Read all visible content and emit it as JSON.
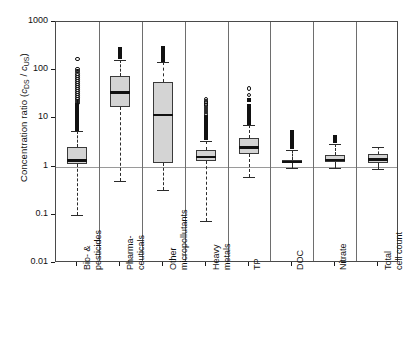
{
  "chart_data": {
    "type": "box",
    "title": "",
    "xlabel": "",
    "ylabel": "Concentration ratio (cDS / cUS)",
    "ylabel_parts": {
      "main": "Concentration ratio  (",
      "c1": "c",
      "sub1": "DS",
      "slash": " / ",
      "c2": "c",
      "sub2": "US",
      "close": ")"
    },
    "yscale": "log",
    "ylim": [
      0.01,
      1000
    ],
    "yticks": [
      1000,
      100,
      10,
      1,
      0.1,
      0.01
    ],
    "ytick_labels": [
      "1000",
      "100",
      "10",
      "1",
      "0.1",
      "0.01"
    ],
    "grid": false,
    "reference_line": 1,
    "legend": "none",
    "categories": [
      "Bio- & pesticides",
      "Pharma- ceuticals",
      "Other micropollutants",
      "Heavy metals",
      "TP",
      "DOC",
      "Nitrate",
      "Total cell count"
    ],
    "category_lines": [
      [
        "Bio- &",
        "pesticides"
      ],
      [
        "Pharma-",
        "ceuticals"
      ],
      [
        "Other",
        "micropollutants"
      ],
      [
        "Heavy",
        "metals"
      ],
      [
        "TP"
      ],
      [
        "DOC"
      ],
      [
        "Nitrate"
      ],
      [
        "Total",
        "cell count"
      ]
    ],
    "boxes": [
      {
        "name": "Bio- & pesticides",
        "lower_whisker": 0.1,
        "q1": 1.15,
        "median": 1.35,
        "q3": 2.6,
        "upper_whisker": 5.5,
        "outliers": [
          6.0,
          6.5,
          7.0,
          7.6,
          8.3,
          9.0,
          9.8,
          10.6,
          11.5,
          12.5,
          13.6,
          14.8,
          16,
          17.5,
          19,
          21,
          23,
          25,
          27,
          30,
          33,
          36,
          40,
          44,
          48,
          53,
          58,
          64,
          70,
          78,
          86,
          95,
          105,
          170
        ]
      },
      {
        "name": "Pharma-ceuticals",
        "lower_whisker": 0.5,
        "q1": 17,
        "median": 35,
        "q3": 75,
        "upper_whisker": 165,
        "outliers": [
          180,
          195,
          215,
          235,
          260,
          285
        ]
      },
      {
        "name": "Other micropollutants",
        "lower_whisker": 0.33,
        "q1": 1.2,
        "median": 12,
        "q3": 58,
        "upper_whisker": 145,
        "outliers": [
          160,
          175,
          190,
          205,
          225,
          250,
          275,
          300
        ]
      },
      {
        "name": "Heavy metals",
        "lower_whisker": 0.075,
        "q1": 1.3,
        "median": 1.6,
        "q3": 2.2,
        "upper_whisker": 3.4,
        "outliers": [
          3.8,
          4.2,
          4.6,
          5.1,
          5.6,
          6.2,
          6.8,
          7.5,
          8.3,
          9.1,
          10,
          11,
          12.2,
          13.5,
          15,
          16.6,
          18.4,
          20.4,
          22.6,
          25
        ]
      },
      {
        "name": "TP",
        "lower_whisker": 0.62,
        "q1": 1.85,
        "median": 2.5,
        "q3": 4.0,
        "upper_whisker": 7.2,
        "outliers": [
          8,
          8.8,
          9.7,
          10.7,
          11.8,
          13,
          14.5,
          16,
          18,
          24,
          31,
          42
        ]
      },
      {
        "name": "DOC",
        "lower_whisker": 0.95,
        "q1": 1.18,
        "median": 1.25,
        "q3": 1.35,
        "upper_whisker": 2.2,
        "outliers": [
          2.5,
          2.8,
          3.2,
          3.6,
          4.1,
          4.7,
          5.4
        ]
      },
      {
        "name": "Nitrate",
        "lower_whisker": 0.93,
        "q1": 1.22,
        "median": 1.4,
        "q3": 1.7,
        "upper_whisker": 3.0,
        "outliers": [
          3.3,
          3.7,
          4.1
        ]
      },
      {
        "name": "Total cell count",
        "lower_whisker": 0.88,
        "q1": 1.2,
        "median": 1.42,
        "q3": 1.8,
        "upper_whisker": 2.6,
        "outliers": []
      }
    ]
  }
}
